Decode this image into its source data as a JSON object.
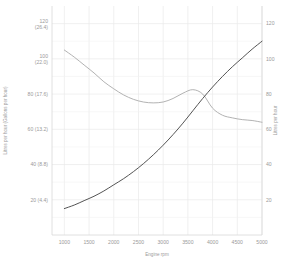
{
  "chart_data": {
    "type": "line",
    "title": "",
    "subtitle": "",
    "xlabel": "Engine rpm",
    "ylabel_left": "Litres per hour (Gallons per hour)",
    "ylabel_right": "Litres per hour",
    "xlim": [
      750,
      5000
    ],
    "ylim_left": [
      0,
      130
    ],
    "ylim_right": [
      0,
      130
    ],
    "grid": true,
    "legend_position": "none",
    "x_ticks": [
      1000,
      1500,
      2000,
      2500,
      3000,
      3500,
      4000,
      4500,
      5000
    ],
    "x_tick_labels": [
      "1000",
      "1500",
      "2000",
      "2500",
      "3000",
      "3500",
      "4000",
      "4500",
      "5000"
    ],
    "y_ticks_left": [
      20,
      40,
      60,
      80,
      100,
      120
    ],
    "y_tick_labels_left": [
      "20 (4.4)",
      "40 (8.8)",
      "60 (13.2)",
      "80 (17.6)",
      "100 (22.0)",
      "120 (26.4)"
    ],
    "y_ticks_right": [
      20,
      40,
      60,
      80,
      100,
      120
    ],
    "y_tick_labels_right": [
      "20",
      "40",
      "60",
      "80",
      "100",
      "120"
    ],
    "series": [
      {
        "name": "upper-curve",
        "color": "#a9a9a9",
        "width": 0.9,
        "x": [
          1000,
          1200,
          1400,
          1600,
          1800,
          2000,
          2200,
          2400,
          2600,
          2800,
          3000,
          3200,
          3400,
          3600,
          3800,
          4000,
          4200,
          4400,
          4600,
          4800,
          5000
        ],
        "y": [
          105,
          101,
          96.5,
          92,
          87,
          83,
          79.5,
          77,
          75.5,
          75,
          75.5,
          77.5,
          80.5,
          82.5,
          80,
          72,
          68,
          66.5,
          65.5,
          65,
          64
        ]
      },
      {
        "name": "lower-curve",
        "color": "#4a4a4a",
        "width": 0.95,
        "x": [
          1000,
          1200,
          1400,
          1600,
          1800,
          2000,
          2200,
          2400,
          2600,
          2800,
          3000,
          3200,
          3400,
          3600,
          3800,
          4000,
          4200,
          4400,
          4600,
          4800,
          5000
        ],
        "y": [
          15,
          17,
          19.5,
          22,
          25,
          28.5,
          32,
          36,
          40.5,
          45.5,
          51,
          57,
          63.5,
          70.5,
          77.5,
          84,
          90,
          95.5,
          100.5,
          105.5,
          110
        ]
      }
    ]
  },
  "axes": {
    "x_title": "Engine rpm",
    "y_left_title": "Litres per hour (Gallons per hour)",
    "y_right_title": "Litres per hour"
  }
}
